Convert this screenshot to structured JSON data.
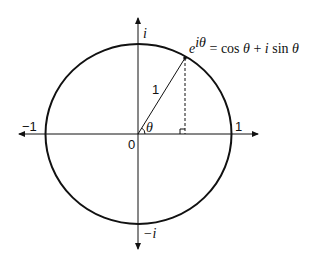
{
  "diagram": {
    "labels": {
      "imag_positive": "i",
      "imag_negative": "−i",
      "real_negative": "−1",
      "real_positive": "1",
      "origin": "0",
      "radius": "1",
      "angle": "θ"
    },
    "formula": {
      "base": "e",
      "exponent": "iθ",
      "equals": " = cos ",
      "theta1": "θ",
      "plus": " + ",
      "i": "i",
      "sin": " sin ",
      "theta2": "θ"
    },
    "colors": {
      "stroke": "#111111",
      "background": "#ffffff"
    }
  }
}
